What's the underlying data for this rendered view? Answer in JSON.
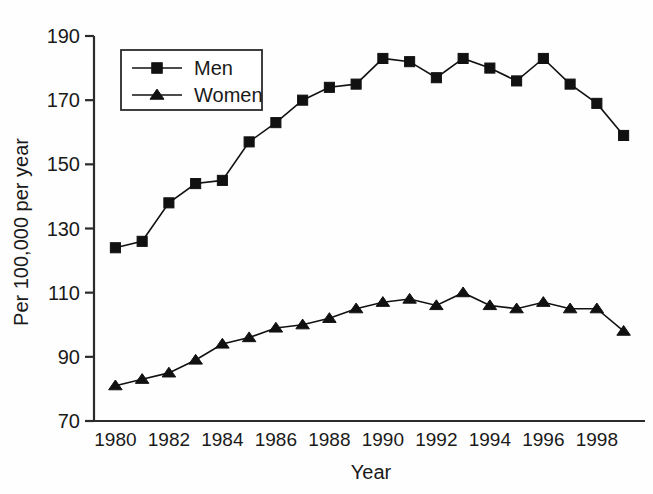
{
  "figure": {
    "background_color": "#fefefe",
    "ink_color": "#111111",
    "axis_color": "#2b2b2b"
  },
  "chart_data": {
    "type": "line",
    "title": "",
    "subtitle": "",
    "xlabel": "Year",
    "ylabel": "Per 100,000 per year",
    "xlim": [
      1979.2,
      1999.8
    ],
    "ylim": [
      70,
      190
    ],
    "xticks": [
      1980,
      1982,
      1984,
      1986,
      1988,
      1990,
      1992,
      1994,
      1996,
      1998
    ],
    "xtick_labels": [
      "1980",
      "1982",
      "1984",
      "1986",
      "1988",
      "1990",
      "1992",
      "1994",
      "1996",
      "1998"
    ],
    "yticks": [
      70,
      90,
      110,
      130,
      150,
      170,
      190
    ],
    "ytick_labels": [
      "70",
      "90",
      "110",
      "130",
      "150",
      "170",
      "190"
    ],
    "grid": false,
    "legend_position": "upper-left-inside",
    "x": [
      1980,
      1981,
      1982,
      1983,
      1984,
      1985,
      1986,
      1987,
      1988,
      1989,
      1990,
      1991,
      1992,
      1993,
      1994,
      1995,
      1996,
      1997,
      1998,
      1999
    ],
    "series": [
      {
        "name": "Men",
        "marker": "square",
        "color": "#111111",
        "values": [
          124,
          126,
          138,
          144,
          145,
          157,
          163,
          170,
          174,
          175,
          183,
          182,
          177,
          183,
          180,
          176,
          183,
          175,
          169,
          159
        ]
      },
      {
        "name": "Women",
        "marker": "triangle",
        "color": "#111111",
        "values": [
          81,
          83,
          85,
          89,
          94,
          96,
          99,
          100,
          102,
          105,
          107,
          108,
          106,
          110,
          106,
          105,
          107,
          105,
          105,
          98
        ]
      }
    ]
  },
  "legend": {
    "entries": [
      {
        "label": "Men",
        "marker": "square"
      },
      {
        "label": "Women",
        "marker": "triangle"
      }
    ]
  }
}
